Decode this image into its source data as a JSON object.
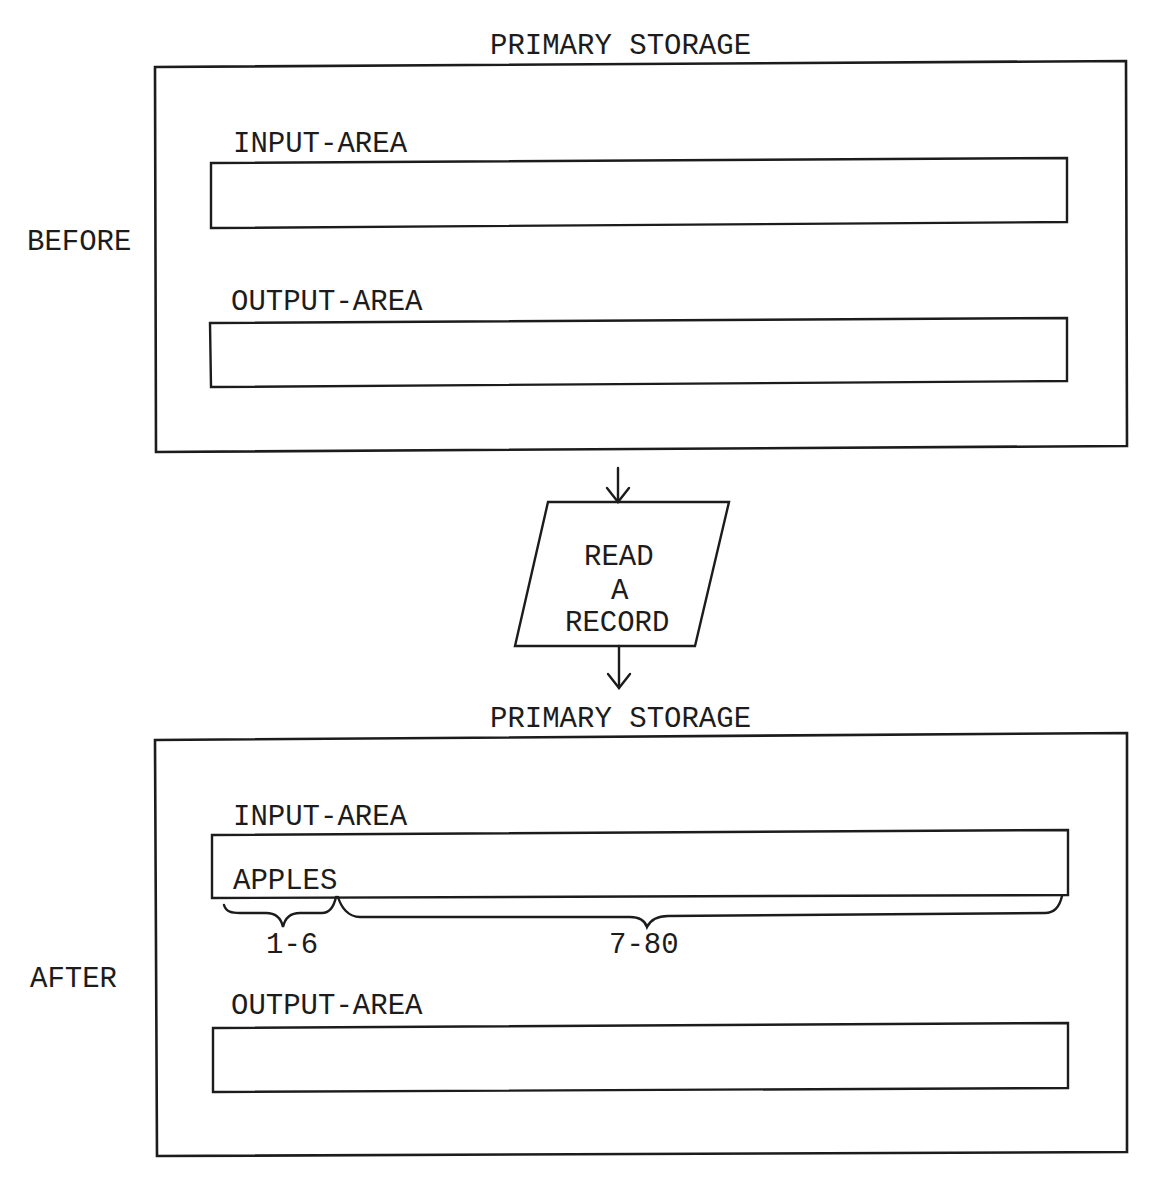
{
  "colors": {
    "ink": "#1c1c1c",
    "paper": "#ffffff"
  },
  "before": {
    "side_label": "BEFORE",
    "storage_title": "PRIMARY STORAGE",
    "input_area": {
      "label": "INPUT-AREA",
      "contents": ""
    },
    "output_area": {
      "label": "OUTPUT-AREA",
      "contents": ""
    }
  },
  "flow": {
    "symbol": "parallelogram-io",
    "lines": [
      "READ",
      "A",
      "RECORD"
    ],
    "arrow_in": "arrow-down",
    "arrow_out": "arrow-down"
  },
  "after": {
    "side_label": "AFTER",
    "storage_title": "PRIMARY STORAGE",
    "input_area": {
      "label": "INPUT-AREA",
      "contents": "APPLES",
      "ranges": [
        {
          "label": "1-6"
        },
        {
          "label": "7-80"
        }
      ]
    },
    "output_area": {
      "label": "OUTPUT-AREA",
      "contents": ""
    }
  }
}
